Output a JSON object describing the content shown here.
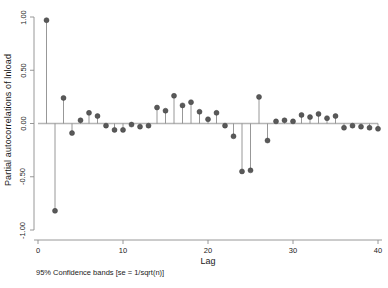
{
  "chart_data": {
    "type": "bar",
    "title": "",
    "subtitle": "",
    "xlabel": "Lag",
    "ylabel": "Partial autocorrelations of lnload",
    "annotation": "95% Confidence bands [se = 1/sqrt(n)]",
    "grid": false,
    "legend": "none",
    "xlim": [
      0,
      41
    ],
    "ylim": [
      -1.0,
      1.0
    ],
    "xticks": [
      "0",
      "10",
      "20",
      "30",
      "40"
    ],
    "xtick_values": [
      0,
      10,
      20,
      30,
      40
    ],
    "yticks": [
      "1.00",
      "0.50",
      "0.00",
      "-0.50",
      "-1.00"
    ],
    "ytick_values": [
      1.0,
      0.5,
      0.0,
      -0.5,
      -1.0
    ],
    "marker": "filled-circle",
    "marker_color": "#595959",
    "stem_color": "#8c8c8c",
    "zero_line_color": "#b5b5b5",
    "axis_color": "#8c8c8c",
    "categories": [
      1,
      2,
      3,
      4,
      5,
      6,
      7,
      8,
      9,
      10,
      11,
      12,
      13,
      14,
      15,
      16,
      17,
      18,
      19,
      20,
      21,
      22,
      23,
      24,
      25,
      26,
      27,
      28,
      29,
      30,
      31,
      32,
      33,
      34,
      35,
      36,
      37,
      38,
      39,
      40
    ],
    "values": [
      0.97,
      -0.82,
      0.24,
      -0.09,
      0.03,
      0.1,
      0.07,
      -0.02,
      -0.06,
      -0.06,
      -0.01,
      -0.03,
      -0.02,
      0.15,
      0.12,
      0.26,
      0.17,
      0.2,
      0.11,
      0.04,
      0.1,
      -0.02,
      -0.12,
      -0.45,
      -0.44,
      0.25,
      -0.16,
      0.02,
      0.03,
      0.02,
      0.08,
      0.06,
      0.09,
      0.05,
      0.07,
      -0.04,
      -0.02,
      -0.03,
      -0.04,
      -0.05
    ]
  }
}
